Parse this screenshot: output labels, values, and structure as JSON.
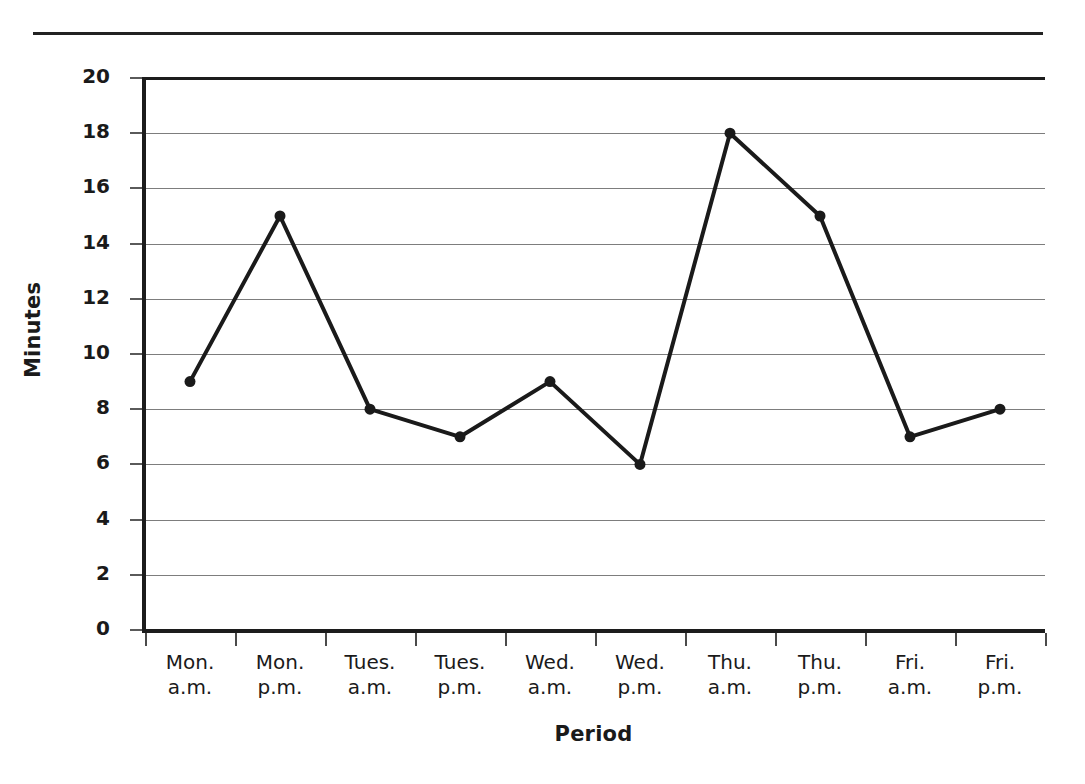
{
  "chart_data": {
    "type": "line",
    "title": "",
    "xlabel": "Period",
    "ylabel": "Minutes",
    "categories": [
      "Mon.\na.m.",
      "Mon.\np.m.",
      "Tues.\na.m.",
      "Tues.\np.m.",
      "Wed.\na.m.",
      "Wed.\np.m.",
      "Thu.\na.m.",
      "Thu.\np.m.",
      "Fri.\na.m.",
      "Fri.\np.m."
    ],
    "values": [
      9,
      15,
      8,
      7,
      9,
      6,
      18,
      15,
      7,
      8
    ],
    "ylim": [
      0,
      20
    ],
    "ytick_labels": [
      "0",
      "2",
      "4",
      "6",
      "8",
      "10",
      "12",
      "14",
      "16",
      "18",
      "20"
    ],
    "ytick_values": [
      0,
      2,
      4,
      6,
      8,
      10,
      12,
      14,
      16,
      18,
      20
    ],
    "grid": true,
    "legend": "none",
    "series_color": "#1a1a1a",
    "gridline_color": "#7d7d7d",
    "axis_color": "#1c1c1c",
    "marker": "filled-circle"
  }
}
